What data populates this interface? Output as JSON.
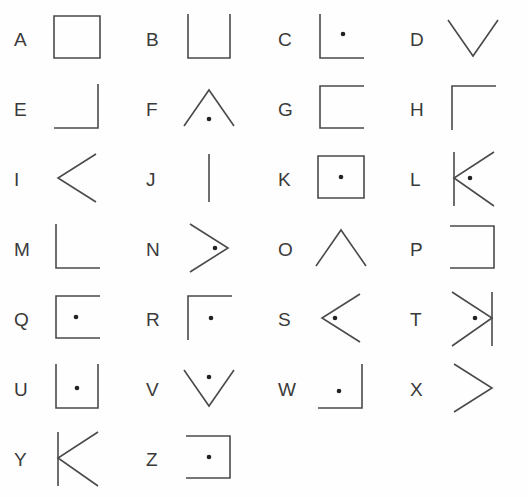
{
  "figure": {
    "background_color": "#ffffff",
    "stroke_color": "#4a4a4a",
    "dot_color": "#222222",
    "columns": 4,
    "rows": 7
  },
  "items": [
    {
      "label": "A",
      "shape": "square",
      "dot": false,
      "row": 1,
      "col": 1
    },
    {
      "label": "B",
      "shape": "u-open-top",
      "dot": false,
      "row": 1,
      "col": 2
    },
    {
      "label": "C",
      "shape": "corner-bottom-left",
      "dot": true,
      "row": 1,
      "col": 3
    },
    {
      "label": "D",
      "shape": "chevron-down",
      "dot": false,
      "row": 1,
      "col": 4
    },
    {
      "label": "E",
      "shape": "corner-bottom-right",
      "dot": false,
      "row": 2,
      "col": 1
    },
    {
      "label": "F",
      "shape": "chevron-up",
      "dot": true,
      "row": 2,
      "col": 2
    },
    {
      "label": "G",
      "shape": "bracket-open-right",
      "dot": false,
      "row": 2,
      "col": 3
    },
    {
      "label": "H",
      "shape": "corner-top-left",
      "dot": false,
      "row": 2,
      "col": 4
    },
    {
      "label": "I",
      "shape": "chevron-left",
      "dot": false,
      "row": 3,
      "col": 1
    },
    {
      "label": "J",
      "shape": "vertical-line",
      "dot": false,
      "row": 3,
      "col": 2
    },
    {
      "label": "K",
      "shape": "square",
      "dot": true,
      "row": 3,
      "col": 3
    },
    {
      "label": "L",
      "shape": "bar-chevron-left",
      "dot": true,
      "row": 3,
      "col": 4
    },
    {
      "label": "M",
      "shape": "corner-bottom-left",
      "dot": false,
      "row": 4,
      "col": 1
    },
    {
      "label": "N",
      "shape": "chevron-right",
      "dot": true,
      "row": 4,
      "col": 2
    },
    {
      "label": "O",
      "shape": "chevron-up",
      "dot": false,
      "row": 4,
      "col": 3
    },
    {
      "label": "P",
      "shape": "bracket-open-left",
      "dot": false,
      "row": 4,
      "col": 4
    },
    {
      "label": "Q",
      "shape": "bracket-open-right",
      "dot": true,
      "row": 5,
      "col": 1
    },
    {
      "label": "R",
      "shape": "corner-top-left",
      "dot": true,
      "row": 5,
      "col": 2
    },
    {
      "label": "S",
      "shape": "chevron-left",
      "dot": true,
      "row": 5,
      "col": 3
    },
    {
      "label": "T",
      "shape": "bar-chevron-right",
      "dot": true,
      "row": 5,
      "col": 4
    },
    {
      "label": "U",
      "shape": "u-open-top",
      "dot": true,
      "row": 6,
      "col": 1
    },
    {
      "label": "V",
      "shape": "chevron-down",
      "dot": true,
      "row": 6,
      "col": 2
    },
    {
      "label": "W",
      "shape": "corner-bottom-right",
      "dot": true,
      "row": 6,
      "col": 3
    },
    {
      "label": "X",
      "shape": "chevron-right",
      "dot": false,
      "row": 6,
      "col": 4
    },
    {
      "label": "Y",
      "shape": "bar-chevron-left",
      "dot": false,
      "row": 7,
      "col": 1
    },
    {
      "label": "Z",
      "shape": "bracket-open-left",
      "dot": true,
      "row": 7,
      "col": 2
    }
  ]
}
